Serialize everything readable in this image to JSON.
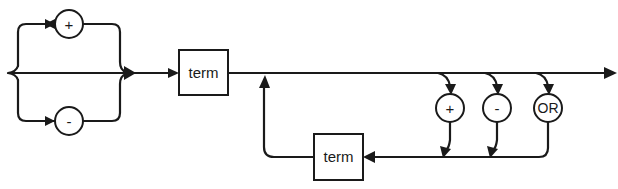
{
  "diagram": {
    "type": "syntax-railroad-diagram",
    "line_color": "#1a1a1a",
    "background": "#ffffff",
    "sign_branch": {
      "options": [
        {
          "label": "+",
          "name": "plus"
        },
        {
          "label": "-",
          "name": "minus"
        }
      ],
      "has_bypass": true
    },
    "first_term": {
      "label": "term"
    },
    "operators": [
      {
        "label": "+",
        "name": "plus"
      },
      {
        "label": "-",
        "name": "minus"
      },
      {
        "label": "OR",
        "name": "or"
      }
    ],
    "loop_term": {
      "label": "term"
    }
  }
}
